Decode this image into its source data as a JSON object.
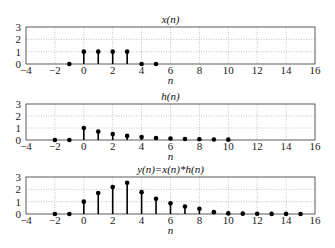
{
  "chart_data": [
    {
      "type": "stem",
      "title": "x(n)",
      "xlabel": "n",
      "ylabel": "",
      "xlim": [
        -4,
        16
      ],
      "ylim": [
        0,
        3
      ],
      "xticks": [
        -4,
        -2,
        0,
        2,
        4,
        6,
        8,
        10,
        12,
        14,
        16
      ],
      "yticks": [
        0,
        1,
        2,
        3
      ],
      "grid": true,
      "x": [
        -1,
        0,
        1,
        2,
        3,
        4,
        5
      ],
      "values": [
        0,
        1,
        1,
        1,
        1,
        0,
        0
      ]
    },
    {
      "type": "stem",
      "title": "h(n)",
      "xlabel": "n",
      "ylabel": "",
      "xlim": [
        -4,
        16
      ],
      "ylim": [
        0,
        3
      ],
      "xticks": [
        -4,
        -2,
        0,
        2,
        4,
        6,
        8,
        10,
        12,
        14,
        16
      ],
      "yticks": [
        0,
        1,
        2,
        3
      ],
      "grid": true,
      "x": [
        -2,
        -1,
        0,
        1,
        2,
        3,
        4,
        5,
        6,
        7,
        8,
        9,
        10
      ],
      "values": [
        0,
        0,
        1,
        0.7,
        0.49,
        0.34,
        0.24,
        0.17,
        0.12,
        0.08,
        0.06,
        0.04,
        0.03
      ]
    },
    {
      "type": "stem",
      "title": "y(n)=x(n)*h(n)",
      "xlabel": "n",
      "ylabel": "",
      "xlim": [
        -4,
        16
      ],
      "ylim": [
        0,
        3
      ],
      "xticks": [
        -4,
        -2,
        0,
        2,
        4,
        6,
        8,
        10,
        12,
        14,
        16
      ],
      "yticks": [
        0,
        1,
        2,
        3
      ],
      "grid": true,
      "x": [
        -2,
        -1,
        0,
        1,
        2,
        3,
        4,
        5,
        6,
        7,
        8,
        9,
        10,
        11,
        12,
        13,
        14,
        15
      ],
      "values": [
        0,
        0,
        1,
        1.7,
        2.19,
        2.53,
        1.77,
        1.24,
        0.87,
        0.61,
        0.43,
        0.15,
        0.05,
        0.03,
        0.02,
        0.01,
        0.01,
        0.0
      ]
    }
  ]
}
